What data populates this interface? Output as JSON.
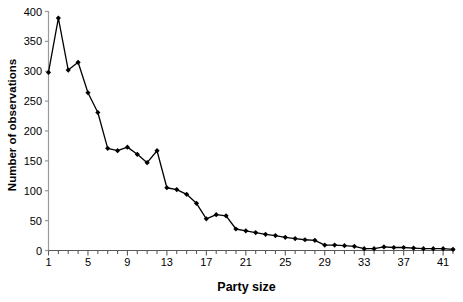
{
  "chart_data": {
    "type": "line",
    "title": "",
    "xlabel": "Party size",
    "ylabel": "Number of observations",
    "xlim": [
      1,
      42
    ],
    "ylim": [
      0,
      400
    ],
    "ytick_step": 50,
    "xtick_step_labeled": 4,
    "grid": false,
    "legend": null,
    "marker": "filled-diamond",
    "line_color": "#000000",
    "marker_color": "#000000",
    "x": [
      1,
      2,
      3,
      4,
      5,
      6,
      7,
      8,
      9,
      10,
      11,
      12,
      13,
      14,
      15,
      16,
      17,
      18,
      19,
      20,
      21,
      22,
      23,
      24,
      25,
      26,
      27,
      28,
      29,
      30,
      31,
      32,
      33,
      34,
      35,
      36,
      37,
      38,
      39,
      40,
      41,
      42
    ],
    "values": [
      298,
      389,
      302,
      315,
      264,
      231,
      171,
      167,
      173,
      161,
      147,
      167,
      105,
      102,
      94,
      79,
      53,
      60,
      58,
      36,
      33,
      30,
      27,
      25,
      22,
      20,
      18,
      17,
      9,
      9,
      8,
      7,
      3,
      3,
      6,
      5,
      5,
      4,
      3,
      3,
      3,
      2
    ],
    "y_tick_labels": [
      "0",
      "50",
      "100",
      "150",
      "200",
      "250",
      "300",
      "350",
      "400"
    ],
    "x_tick_labels": [
      "1",
      "5",
      "9",
      "13",
      "17",
      "21",
      "25",
      "29",
      "33",
      "37",
      "41"
    ]
  }
}
